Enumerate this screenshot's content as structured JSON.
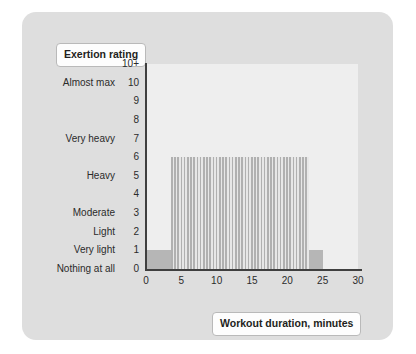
{
  "chart_data": {
    "type": "area",
    "title": "",
    "xlabel": "Workout duration, minutes",
    "ylabel": "Exertion rating",
    "xlim": [
      0,
      30
    ],
    "ylim": [
      0,
      11
    ],
    "grid": false,
    "legend": "none",
    "xticks": [
      {
        "value": 0,
        "label": "0"
      },
      {
        "value": 5,
        "label": "5"
      },
      {
        "value": 10,
        "label": "10"
      },
      {
        "value": 15,
        "label": "15"
      },
      {
        "value": 20,
        "label": "20"
      },
      {
        "value": 25,
        "label": "25"
      },
      {
        "value": 30,
        "label": "30"
      }
    ],
    "yticks": [
      {
        "value": 11,
        "number": "10+",
        "description": ""
      },
      {
        "value": 10,
        "number": "10",
        "description": "Almost max"
      },
      {
        "value": 9,
        "number": "9",
        "description": ""
      },
      {
        "value": 8,
        "number": "8",
        "description": ""
      },
      {
        "value": 7,
        "number": "7",
        "description": "Very heavy"
      },
      {
        "value": 6,
        "number": "6",
        "description": ""
      },
      {
        "value": 5,
        "number": "5",
        "description": "Heavy"
      },
      {
        "value": 4,
        "number": "4",
        "description": ""
      },
      {
        "value": 3,
        "number": "3",
        "description": "Moderate"
      },
      {
        "value": 2,
        "number": "2",
        "description": "Light"
      },
      {
        "value": 1,
        "number": "1",
        "description": "Very light"
      },
      {
        "value": 0,
        "number": "0",
        "description": "Nothing at all"
      }
    ],
    "series": [
      {
        "name": "baseline",
        "style": "solid",
        "color": "#b6b6b6",
        "x_start": 0,
        "x_end": 25,
        "y_value": 1
      },
      {
        "name": "main-effort",
        "style": "striped",
        "color": "#b0b0b0",
        "x_start": 3.5,
        "x_end": 23,
        "y_value": 6
      }
    ]
  },
  "labels": {
    "y_axis_title": "Exertion rating",
    "x_axis_title": "Workout duration, minutes"
  }
}
